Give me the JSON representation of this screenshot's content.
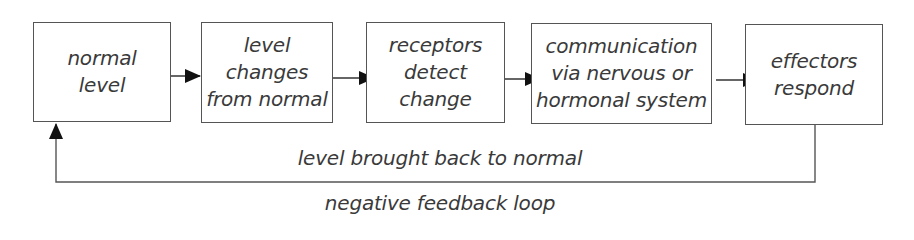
{
  "diagram": {
    "type": "flowchart",
    "boxes": [
      {
        "id": "normal-level",
        "lines": [
          "normal",
          "level"
        ]
      },
      {
        "id": "level-changes",
        "lines": [
          "level",
          "changes",
          "from normal"
        ]
      },
      {
        "id": "receptors-detect",
        "lines": [
          "receptors",
          "detect",
          "change"
        ]
      },
      {
        "id": "communication",
        "lines": [
          "communication",
          "via nervous or",
          "hormonal system"
        ]
      },
      {
        "id": "effectors-respond",
        "lines": [
          "effectors",
          "respond"
        ]
      }
    ],
    "edges": [
      {
        "from": "normal-level",
        "to": "level-changes"
      },
      {
        "from": "level-changes",
        "to": "receptors-detect"
      },
      {
        "from": "receptors-detect",
        "to": "communication"
      },
      {
        "from": "communication",
        "to": "effectors-respond"
      },
      {
        "from": "effectors-respond",
        "to": "normal-level",
        "label": "level brought back to normal"
      }
    ],
    "feedback_label": "level brought back to normal",
    "caption": "negative feedback loop",
    "colors": {
      "line": "#555555",
      "arrowhead": "#111111",
      "text": "#3a3a3a",
      "background": "#ffffff"
    }
  }
}
